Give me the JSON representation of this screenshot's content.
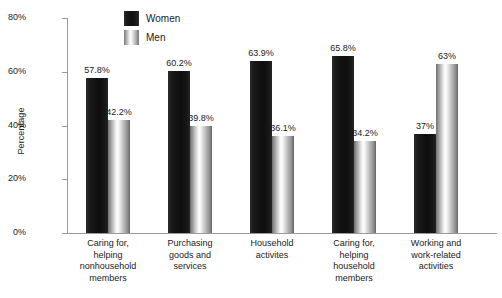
{
  "chart_data": {
    "type": "bar",
    "title": "",
    "subtitle": "",
    "xlabel": "",
    "ylabel": "Percentage",
    "ylim": [
      0,
      80
    ],
    "yticks": [
      0,
      20,
      40,
      60,
      80
    ],
    "ytick_labels": [
      "0%",
      "20%",
      "40%",
      "60%",
      "80%"
    ],
    "grid": false,
    "legend_position": "top-center-left",
    "categories": [
      "Caring for,\nhelping\nnonhousehold\nmembers",
      "Purchasing\ngoods and\nservices",
      "Household\nactivites",
      "Caring for,\nhelping\nhousehold\nmembers",
      "Working and\nwork-related\nactivities"
    ],
    "series": [
      {
        "name": "Women",
        "color": "#111111",
        "values": [
          57.8,
          60.2,
          63.9,
          65.8,
          37
        ],
        "labels": [
          "57.8%",
          "60.2%",
          "63.9%",
          "65.8%",
          "37%"
        ]
      },
      {
        "name": "Men",
        "color": "#c8c8c8",
        "values": [
          42.2,
          39.8,
          36.1,
          34.2,
          63
        ],
        "labels": [
          "42.2%",
          "39.8%",
          "36.1%",
          "34.2%",
          "63%"
        ]
      }
    ]
  },
  "legend": {
    "items": [
      {
        "label": "Women"
      },
      {
        "label": "Men"
      }
    ]
  }
}
